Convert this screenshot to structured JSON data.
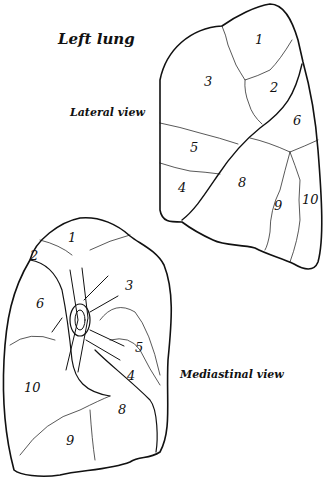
{
  "diagram": {
    "title": "Left lung",
    "views": {
      "lateral": {
        "label": "Lateral view",
        "segments": [
          "1",
          "2",
          "3",
          "4",
          "5",
          "6",
          "8",
          "9",
          "10"
        ]
      },
      "mediastinal": {
        "label": "Mediastinal view",
        "segments": [
          "1",
          "2",
          "3",
          "4",
          "5",
          "6",
          "8",
          "9",
          "10"
        ]
      }
    }
  }
}
